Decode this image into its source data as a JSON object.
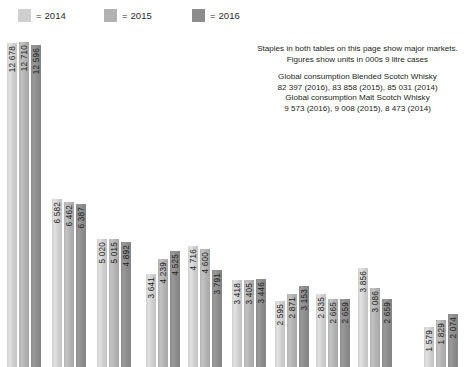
{
  "legend": {
    "items": [
      {
        "label": "= 2014",
        "color": "#cfcfcf",
        "name": "legend-2014"
      },
      {
        "label": "= 2015",
        "color": "#b2b2b2",
        "name": "legend-2015"
      },
      {
        "label": "= 2016",
        "color": "#8c8c8c",
        "name": "legend-2016"
      }
    ]
  },
  "note": {
    "line1": "Staples in both tables on this page show major markets.",
    "line2": "Figures show units in 000s 9 litre cases",
    "line3": "Global consumption Blended Scotch Whisky",
    "line4": "82 397 (2016), 83 858 (2015), 85 031 (2014)",
    "line5": "Global consumption Malt Scotch Whisky",
    "line6": "9 573 (2016), 9 008 (2015), 8 473 (2014)"
  },
  "chart_data": {
    "type": "bar",
    "title": "",
    "xlabel": "",
    "ylabel": "",
    "ylim": [
      0,
      13200
    ],
    "grid": false,
    "legend_position": "top-left",
    "categories": [
      "1",
      "2",
      "3",
      "4",
      "5",
      "6",
      "7",
      "8",
      "9",
      "10"
    ],
    "series": [
      {
        "name": "2014",
        "color": "#cfcfcf",
        "values": [
          12678,
          6582,
          5020,
          3641,
          4716,
          3418,
          2595,
          2835,
          3856,
          1579
        ]
      },
      {
        "name": "2015",
        "color": "#b2b2b2",
        "values": [
          12710,
          6462,
          5015,
          4239,
          4600,
          3405,
          2871,
          2665,
          3086,
          1829
        ]
      },
      {
        "name": "2016",
        "color": "#8c8c8c",
        "values": [
          12596,
          6387,
          4892,
          4525,
          3791,
          3446,
          3153,
          2659,
          2659,
          2074
        ]
      }
    ],
    "bar_labels": [
      [
        "12 678",
        "12 710",
        "12 596"
      ],
      [
        "6 582",
        "6 462",
        "6 387"
      ],
      [
        "5 020",
        "5 015",
        "4 892"
      ],
      [
        "3 641",
        "4 239",
        "4 525"
      ],
      [
        "4 716",
        "4 600",
        "3 791"
      ],
      [
        "3 418",
        "3 405",
        "3 446"
      ],
      [
        "2 595",
        "2 871",
        "3 153"
      ],
      [
        "2 835",
        "2 665",
        "2 659"
      ],
      [
        "3 856",
        "3 086",
        "2 659"
      ],
      [
        "1 579",
        "1 829",
        "2 074"
      ]
    ]
  },
  "layout": {
    "legend_x": [
      18,
      104,
      192
    ],
    "group_x": [
      7,
      52,
      97,
      146,
      188,
      232,
      275,
      316,
      358,
      424
    ],
    "bar_pitch": 12,
    "bar_width": 10,
    "plot_height": 339,
    "max_value": 13250
  }
}
